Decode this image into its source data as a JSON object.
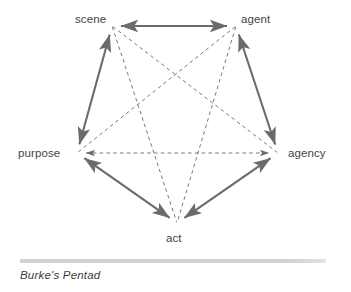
{
  "figure": {
    "name": "burkes-pentad-diagram",
    "caption": "Burke's Pentad",
    "background_color": "#ffffff",
    "solid_edge_color": "#6b6b6b",
    "dashed_edge_color": "#6b6b6b",
    "label_color": "#444444",
    "divider_color": "#d2d2d2"
  },
  "nodes": [
    {
      "id": "scene",
      "label": "scene",
      "x": 112,
      "y": 26,
      "label_x": 75,
      "label_y": 13
    },
    {
      "id": "agent",
      "label": "agent",
      "x": 236,
      "y": 26,
      "label_x": 241,
      "label_y": 13
    },
    {
      "id": "agency",
      "label": "agency",
      "x": 278,
      "y": 153,
      "label_x": 288,
      "label_y": 147
    },
    {
      "id": "act",
      "label": "act",
      "x": 177,
      "y": 223,
      "label_x": 166,
      "label_y": 232
    },
    {
      "id": "purpose",
      "label": "purpose",
      "x": 77,
      "y": 153,
      "label_x": 18,
      "label_y": 147
    }
  ],
  "edges": [
    {
      "id": "scene-agent",
      "from": "scene",
      "to": "agent",
      "style": "solid",
      "arrows": "both"
    },
    {
      "id": "agent-agency",
      "from": "agent",
      "to": "agency",
      "style": "solid",
      "arrows": "both"
    },
    {
      "id": "agency-act",
      "from": "agency",
      "to": "act",
      "style": "solid",
      "arrows": "both"
    },
    {
      "id": "act-purpose",
      "from": "act",
      "to": "purpose",
      "style": "solid",
      "arrows": "both"
    },
    {
      "id": "purpose-scene",
      "from": "purpose",
      "to": "scene",
      "style": "solid",
      "arrows": "both"
    },
    {
      "id": "scene-agency",
      "from": "scene",
      "to": "agency",
      "style": "dashed",
      "arrows": "none"
    },
    {
      "id": "scene-act",
      "from": "scene",
      "to": "act",
      "style": "dashed",
      "arrows": "none"
    },
    {
      "id": "agent-purpose",
      "from": "agent",
      "to": "purpose",
      "style": "dashed",
      "arrows": "none"
    },
    {
      "id": "agent-act",
      "from": "agent",
      "to": "act",
      "style": "dashed",
      "arrows": "none"
    },
    {
      "id": "purpose-agency",
      "from": "purpose",
      "to": "agency",
      "style": "dashed",
      "arrows": "both"
    }
  ]
}
